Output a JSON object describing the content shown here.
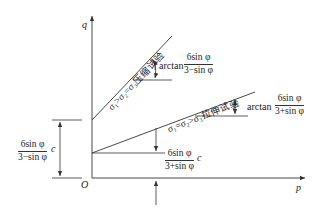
{
  "axes": {
    "y_label": "q",
    "x_label": "p",
    "origin_label": "O"
  },
  "lines": {
    "compression": {
      "label": "σ₁>σ₂=σ₃压缩试验",
      "slope_prefix": "arctan",
      "slope_num": "6sin φ",
      "slope_den": "3−sin φ"
    },
    "extension": {
      "label": "σ₁=σ₂>σ₃拉伸试验",
      "slope_prefix": "arctan",
      "slope_num": "6sin φ",
      "slope_den": "3+sin φ"
    }
  },
  "intercepts": {
    "compression": {
      "num": "6sin φ",
      "den": "3−sin φ",
      "suffix": "c"
    },
    "extension": {
      "num": "6sin φ",
      "den": "3+sin φ",
      "suffix": "c"
    }
  },
  "colors": {
    "stroke": "#333333",
    "text": "#222222"
  }
}
